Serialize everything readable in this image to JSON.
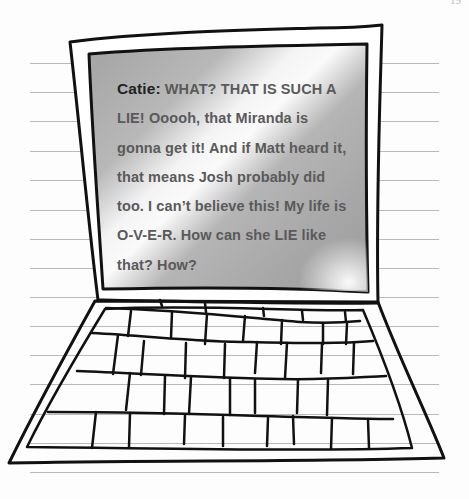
{
  "page": {
    "page_number": "19",
    "ruled_lines_y": [
      63,
      92,
      121,
      151,
      180,
      210,
      239,
      268,
      297,
      326,
      355,
      384,
      414,
      443,
      472
    ]
  },
  "laptop": {
    "screen": {
      "speaker": "Catie:",
      "message_lines": [
        "WHAT? THAT IS SUCH A",
        "LIE! Ooooh, that Miranda is",
        "gonna get it! And if Matt heard it,",
        "that means Josh probably did",
        "too. I can’t believe this! My life is",
        "O-V-E-R. How can she LIE like",
        "that? How?"
      ],
      "full_message": "WHAT? THAT IS SUCH A LIE! Ooooh, that Miranda is gonna get it! And if Matt heard it, that means Josh probably did too. I can’t believe this! My life is O-V-E-R. How can she LIE like that? How?"
    },
    "keyboard": {
      "rows": 4
    }
  },
  "colors": {
    "paper": "#fdfdfd",
    "rule": "#b9b9b9",
    "ink": "#111111",
    "screen_gray": "#a9a9a9",
    "screen_text": "#5a5a5a",
    "speaker_text": "#222222"
  }
}
